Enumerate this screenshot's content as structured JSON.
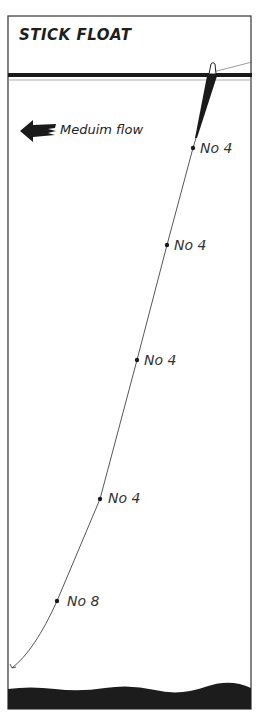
{
  "diagram": {
    "title": "STICK FLOAT",
    "flow": {
      "label": "Meduim flow",
      "direction": "left",
      "icon": "arrow-left-icon"
    },
    "shots": [
      {
        "label": "No 4",
        "x": 193,
        "y": 148
      },
      {
        "label": "No 4",
        "x": 167,
        "y": 245
      },
      {
        "label": "No 4",
        "x": 137,
        "y": 360
      },
      {
        "label": "No 4",
        "x": 100,
        "y": 499
      },
      {
        "label": "No 8",
        "x": 57,
        "y": 601
      }
    ],
    "colors": {
      "ink": "#1a1a1a",
      "background": "#ffffff",
      "riverbed": "#1c1c1c"
    }
  }
}
